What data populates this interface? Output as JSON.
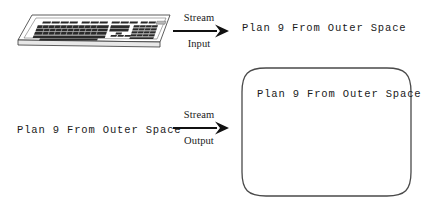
{
  "diagram": {
    "background_color": "#ffffff",
    "ink_color": "#1a1a1a",
    "input_arrow": {
      "label_top": "Stream",
      "label_bottom": "Input",
      "direction": "right"
    },
    "output_arrow": {
      "label_top": "Stream",
      "label_bottom": "Output",
      "direction": "right"
    },
    "keyboard": {
      "icon": "keyboard-icon",
      "description": "keyboard line drawing"
    },
    "screen": {
      "icon": "monitor-screen",
      "text": "Plan 9 From Outer Space"
    },
    "texts": {
      "top_right": "Plan 9 From Outer Space",
      "bottom_left": "Plan 9 From Outer Space"
    }
  }
}
